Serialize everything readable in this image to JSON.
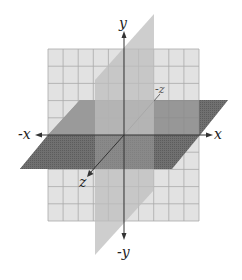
{
  "diagram": {
    "grid": {
      "columns": 10,
      "rows": 10
    },
    "planes": [
      {
        "name": "xy-plane",
        "color": "#e2e2e2",
        "grid_color": "#a9a9a9"
      },
      {
        "name": "yz-plane",
        "color": "#c4c4c4"
      },
      {
        "name": "xz-plane",
        "color": "#6f6f6f"
      }
    ],
    "axes": {
      "color": "#333333",
      "labels": {
        "y_pos": "y",
        "y_neg": "-y",
        "x_pos": "x",
        "x_neg": "-x",
        "z_pos": "z",
        "z_neg": "-z"
      }
    }
  }
}
